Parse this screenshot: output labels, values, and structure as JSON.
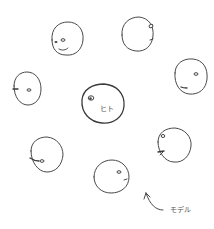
{
  "diagram": {
    "type": "hand-drawn sketch",
    "background": "#ffffff",
    "stroke_color": "#4a4a4a",
    "center_node": {
      "label": "ヒト",
      "cx": 103,
      "cy": 104,
      "r": 21
    },
    "surrounding_nodes": [
      {
        "id": "top-left",
        "cx": 67,
        "cy": 39,
        "r": 16,
        "face": "two-eyes-smile"
      },
      {
        "id": "top-right",
        "cx": 137,
        "cy": 34,
        "r": 16,
        "face": "eye-right-edge"
      },
      {
        "id": "right",
        "cx": 191,
        "cy": 77,
        "r": 17,
        "face": "eye-and-mouth"
      },
      {
        "id": "left",
        "cx": 27,
        "cy": 89,
        "r": 14,
        "face": "eye-left-edge"
      },
      {
        "id": "bottom-left",
        "cx": 47,
        "cy": 154,
        "r": 16,
        "face": "eye-with-line"
      },
      {
        "id": "bottom-right",
        "cx": 174,
        "cy": 145,
        "r": 17,
        "face": "eye-left-edge"
      },
      {
        "id": "bottom-center",
        "cx": 112,
        "cy": 176,
        "r": 17,
        "face": "eye-right"
      }
    ],
    "annotation": {
      "label": "モデル",
      "arrow": "curved arrow pointing up-left toward bottom-center node"
    }
  }
}
